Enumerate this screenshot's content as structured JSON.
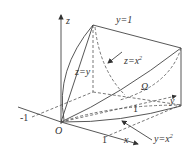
{
  "diagram": {
    "type": "3d-region-sketch",
    "axes": {
      "z_label": "z",
      "x_label": "x",
      "y_label": "y",
      "origin_label": "O"
    },
    "ticks": {
      "x_neg_one": "-1",
      "x_one": "1",
      "y_one": "1"
    },
    "surfaces": {
      "top_plane": "y=1",
      "z_x2": "z=x",
      "z_x2_sup": "2",
      "z_y": "z=y",
      "base_curve": "y=x",
      "base_curve_sup": "2"
    },
    "region_label": "Ω",
    "colors": {
      "line": "#444444",
      "background": "#ffffff"
    }
  }
}
